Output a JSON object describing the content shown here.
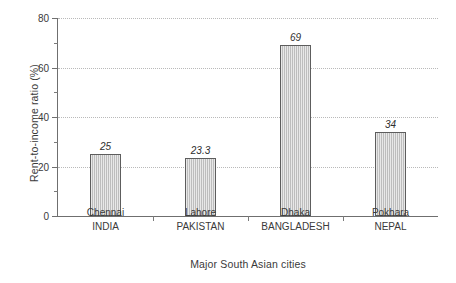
{
  "chart_data": {
    "type": "bar",
    "title": "",
    "subtitle": "",
    "xlabel": "Major South Asian cities",
    "ylabel": "Rent-to-income ratio (%)",
    "categories": [
      "Chennai",
      "Lahore",
      "Dhaka",
      "Pokhara"
    ],
    "category_sublabels": [
      "INDIA",
      "PAKISTAN",
      "BANGLADESH",
      "NEPAL"
    ],
    "values": [
      25,
      23.3,
      69,
      34
    ],
    "value_labels": [
      "25",
      "23.3",
      "69",
      "34"
    ],
    "ylim": [
      0,
      80
    ],
    "xlim": [
      0,
      4
    ],
    "y_major_ticks": [
      0,
      20,
      40,
      60,
      80
    ],
    "y_major_tick_labels": [
      "0",
      "20",
      "40",
      "60",
      "80"
    ],
    "y_minor_ticks": [
      10,
      30,
      50,
      70
    ],
    "gridlines": {
      "y_values": [
        20,
        40,
        60,
        80
      ],
      "style": "dotted",
      "color": "#b9b9b9",
      "x_grid": false
    },
    "legend": {
      "visible": false,
      "position": "none"
    },
    "bar_style": {
      "fill_color": "#cccccc",
      "edge_color": "#5d5d5d",
      "hatch": "vertical-lines"
    },
    "axis_color": "#6f6f6f",
    "text_color": "#3a3a3a",
    "background_color": "#ffffff",
    "value_label_style": "italic"
  }
}
